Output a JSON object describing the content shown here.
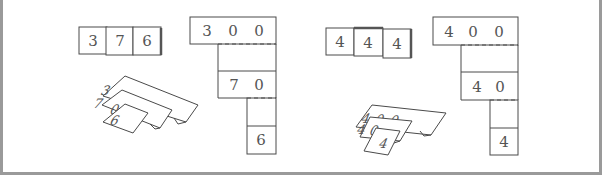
{
  "figure": {
    "colors": {
      "frame": "#9a9a9a",
      "line": "#4a4a4a",
      "text": "#555555"
    },
    "examples": [
      {
        "number": "376",
        "combined_cards": [
          "3",
          "7",
          "6"
        ],
        "expanded_cards": {
          "hundreds": [
            "3",
            "0",
            "0"
          ],
          "tens": [
            "7",
            "0"
          ],
          "ones": [
            "6"
          ]
        },
        "folded_stack": {
          "hundreds": [
            "3",
            "0",
            "0"
          ],
          "tens": [
            "7",
            "0"
          ],
          "ones": "6"
        }
      },
      {
        "number": "444",
        "combined_cards": [
          "4",
          "4",
          "4"
        ],
        "expanded_cards": {
          "hundreds": [
            "4",
            "0",
            "0"
          ],
          "tens": [
            "4",
            "0"
          ],
          "ones": [
            "4"
          ]
        },
        "folded_stack": {
          "hundreds": [
            "4",
            "0",
            "0"
          ],
          "tens": [
            "4",
            "0"
          ],
          "ones": "4"
        }
      }
    ]
  }
}
